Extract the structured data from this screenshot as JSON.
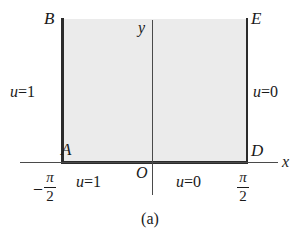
{
  "figure": {
    "caption": "(a)",
    "axes": {
      "x_label": "x",
      "y_label": "y",
      "origin_label": "O"
    },
    "vertices": {
      "top_left": "B",
      "top_right": "E",
      "bottom_left": "A",
      "bottom_right": "D"
    },
    "boundary_conditions": {
      "left_edge": {
        "u": "u",
        "eq": "=",
        "value": "1"
      },
      "right_edge": {
        "u": "u",
        "eq": "=",
        "value": "0"
      },
      "bottom_left": {
        "u": "u",
        "eq": "=",
        "value": "1"
      },
      "bottom_right": {
        "u": "u",
        "eq": "=",
        "value": "0"
      }
    },
    "x_ticks": [
      {
        "sign": "–",
        "numerator": "π",
        "denominator": "2"
      },
      {
        "sign": "",
        "numerator": "π",
        "denominator": "2"
      }
    ],
    "colors": {
      "region_fill": "#ebebeb",
      "edge_stroke": "#2b2b2b",
      "axis_stroke": "#4a4a4a",
      "text": "#1a1a1a",
      "background": "#ffffff"
    }
  }
}
